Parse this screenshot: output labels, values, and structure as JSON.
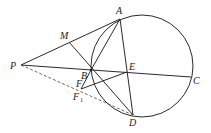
{
  "diagram": {
    "type": "geometry",
    "circle": {
      "cx": 142,
      "cy": 66,
      "r": 51
    },
    "points": {
      "A": {
        "x": 120,
        "y": 19,
        "label": "A"
      },
      "M": {
        "x": 69,
        "y": 42,
        "label": "M"
      },
      "P": {
        "x": 21,
        "y": 65,
        "label": "P"
      },
      "B": {
        "x": 91,
        "y": 70,
        "label": "B"
      },
      "E": {
        "x": 127,
        "y": 72,
        "label": "E"
      },
      "C": {
        "x": 191,
        "y": 77,
        "label": "C"
      },
      "F": {
        "x": 81,
        "y": 88,
        "label": "F"
      },
      "F1": {
        "x": 81,
        "y": 90,
        "label": "F",
        "subscript": "1"
      },
      "D": {
        "x": 133,
        "y": 115,
        "label": "D"
      }
    },
    "segments": [
      [
        "P",
        "A"
      ],
      [
        "P",
        "C"
      ],
      [
        "A",
        "D"
      ],
      [
        "A",
        "B"
      ],
      [
        "M",
        "D"
      ],
      [
        "B",
        "E"
      ],
      [
        "F",
        "E"
      ],
      [
        "F",
        "B"
      ],
      [
        "B",
        "D"
      ]
    ],
    "dashed_segments": [
      [
        "P",
        "D"
      ]
    ]
  }
}
